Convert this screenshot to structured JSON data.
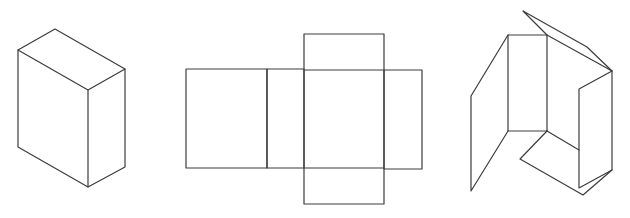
{
  "diagram": {
    "description": "Three stages of a rectangular box: assembled 3D box, flat unfolded net, and partially folded box",
    "stroke_color": "#3c3c3c",
    "background": "#ffffff",
    "figures": [
      {
        "id": "assembled-box",
        "label": "",
        "polylines": [
          [
            [
              18,
              50
            ],
            [
              55,
              29
            ],
            [
              125,
              69
            ],
            [
              88,
              90
            ],
            [
              18,
              50
            ]
          ],
          [
            [
              18,
              50
            ],
            [
              18,
              147
            ],
            [
              88,
              187
            ],
            [
              125,
              167
            ],
            [
              125,
              69
            ]
          ],
          [
            [
              88,
              90
            ],
            [
              88,
              187
            ]
          ]
        ]
      },
      {
        "id": "box-net",
        "label": "",
        "rects": [
          {
            "x": 186,
            "y": 69,
            "w": 81,
            "h": 99
          },
          {
            "x": 267,
            "y": 69,
            "w": 37,
            "h": 99
          },
          {
            "x": 304,
            "y": 34,
            "w": 80,
            "h": 170
          },
          {
            "x": 384,
            "y": 70,
            "w": 38,
            "h": 99
          }
        ],
        "lines": [
          [
            [
              304,
              70
            ],
            [
              384,
              70
            ]
          ],
          [
            [
              304,
              168
            ],
            [
              384,
              168
            ]
          ]
        ]
      },
      {
        "id": "folding-box",
        "label": "",
        "polylines": [
          [
            [
              508,
              35
            ],
            [
              547,
              35
            ],
            [
              547,
              131
            ],
            [
              508,
              131
            ],
            [
              508,
              35
            ]
          ],
          [
            [
              508,
              35
            ],
            [
              471,
              96
            ],
            [
              471,
              191
            ],
            [
              508,
              131
            ]
          ],
          [
            [
              547,
              35
            ],
            [
              523,
              11
            ],
            [
              587,
              47
            ],
            [
              612,
              71
            ]
          ],
          [
            [
              547,
              35
            ],
            [
              612,
              71
            ]
          ],
          [
            [
              612,
              71
            ],
            [
              579,
              89
            ],
            [
              579,
              188
            ],
            [
              612,
              170
            ],
            [
              612,
              71
            ]
          ],
          [
            [
              547,
              131
            ],
            [
              520,
              159
            ],
            [
              583,
              195
            ],
            [
              612,
              170
            ]
          ],
          [
            [
              547,
              131
            ],
            [
              579,
              150
            ]
          ]
        ]
      }
    ]
  }
}
